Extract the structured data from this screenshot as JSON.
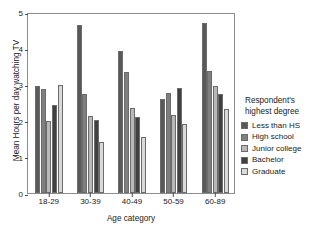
{
  "chart_data": {
    "type": "bar",
    "title": "",
    "subtitle": "",
    "xlabel": "Age category",
    "ylabel": "Mean Hours per day watching TV",
    "categories": [
      "18-29",
      "30-39",
      "40-49",
      "50-59",
      "60-89"
    ],
    "ylim": [
      0,
      5
    ],
    "yticks": [
      "0",
      "1",
      "2",
      "3",
      "4",
      "5"
    ],
    "grid": false,
    "legend_position": "right",
    "legend_title": "Respondent's highest degree",
    "legend_title_lines": [
      "Respondent's",
      "highest degree"
    ],
    "series": [
      {
        "name": "Less than HS",
        "color": "#595959",
        "values": [
          2.95,
          4.64,
          3.91,
          2.59,
          4.7
        ]
      },
      {
        "name": "High school",
        "color": "#7f7f7f",
        "values": [
          2.88,
          2.74,
          3.33,
          2.77,
          3.38
        ]
      },
      {
        "name": "Junior college",
        "color": "#b8b8b8",
        "values": [
          2.0,
          2.14,
          2.35,
          2.15,
          2.96
        ]
      },
      {
        "name": "Bachelor",
        "color": "#404040",
        "values": [
          2.42,
          2.03,
          2.09,
          2.89,
          2.74
        ]
      },
      {
        "name": "Graduate",
        "color": "#d9d9d9",
        "values": [
          2.99,
          1.42,
          1.54,
          1.91,
          2.31
        ]
      }
    ]
  },
  "axes": {
    "frame_color": "#8c8c8c",
    "tick_color": "#4d4d4d",
    "text_color": "#1a1a1a"
  }
}
